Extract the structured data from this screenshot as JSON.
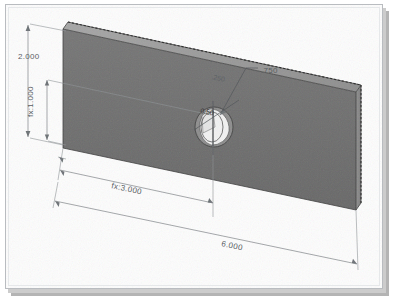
{
  "app": {
    "kind": "cad-3d-viewport",
    "title": "",
    "background_color": "#fdfdfd",
    "frame_border_color": "#b9bcc0",
    "shadow_color": "#b4b4b4"
  },
  "model": {
    "name": "rectangular-plate-with-hole",
    "face_front_color": "#6e6e6e",
    "face_top_color": "#9a9a9a",
    "face_end_color": "#878787",
    "hole_highlight_color": "#f4f4f4",
    "hole_shadow_color": "#8a8a8a",
    "selected_edge_color": "#2c2c2c"
  },
  "dimensions": [
    {
      "id": "height",
      "label": "2.000",
      "value": 2.0,
      "driven": false,
      "orientation": "vertical",
      "location": "left-outer"
    },
    {
      "id": "hole-height",
      "label": "fx:1.000",
      "value": 1.0,
      "driven": true,
      "orientation": "vertical",
      "location": "left-inner"
    },
    {
      "id": "hole-x",
      "label": "fx:3.000",
      "value": 3.0,
      "driven": true,
      "orientation": "horizontal",
      "location": "bottom-inner"
    },
    {
      "id": "length",
      "label": "6.000",
      "value": 6.0,
      "driven": false,
      "orientation": "horizontal",
      "location": "bottom-outer"
    },
    {
      "id": "thickness",
      "label": ".250",
      "value": 0.25,
      "driven": false,
      "orientation": "rotated",
      "location": "top-edge"
    },
    {
      "id": "hole-diameter",
      "label": ".750",
      "value": 0.75,
      "driven": false,
      "orientation": "leader",
      "location": "upper-right-of-hole"
    },
    {
      "id": "hole-inner",
      "label": "0.50",
      "value": 0.5,
      "driven": false,
      "orientation": "rotated",
      "location": "over-hole"
    }
  ],
  "labels": {
    "height": "2.000",
    "hole_height": "fx:1.000",
    "hole_x": "fx:3.000",
    "length": "6.000",
    "thickness": ".250",
    "hole_diameter": ".750",
    "hole_inner": "0.50"
  }
}
